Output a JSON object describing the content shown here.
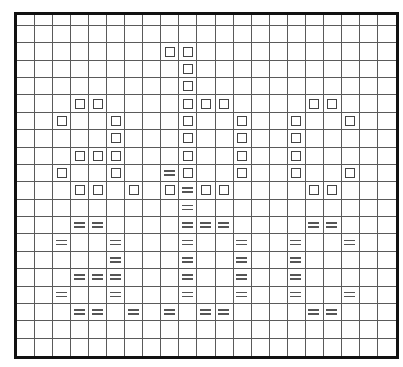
{
  "pattern": {
    "columns": 21,
    "rows": 20,
    "legend_symbols": {
      "S": "square-symbol",
      "E": "equals-symbol"
    },
    "cells": [
      {
        "row": 2,
        "col": 8,
        "symbol": "S"
      },
      {
        "row": 2,
        "col": 9,
        "symbol": "S"
      },
      {
        "row": 3,
        "col": 9,
        "symbol": "S"
      },
      {
        "row": 4,
        "col": 9,
        "symbol": "S"
      },
      {
        "row": 5,
        "col": 3,
        "symbol": "S"
      },
      {
        "row": 5,
        "col": 4,
        "symbol": "S"
      },
      {
        "row": 5,
        "col": 9,
        "symbol": "S"
      },
      {
        "row": 5,
        "col": 10,
        "symbol": "S"
      },
      {
        "row": 5,
        "col": 11,
        "symbol": "S"
      },
      {
        "row": 5,
        "col": 16,
        "symbol": "S"
      },
      {
        "row": 5,
        "col": 17,
        "symbol": "S"
      },
      {
        "row": 6,
        "col": 2,
        "symbol": "S"
      },
      {
        "row": 6,
        "col": 5,
        "symbol": "S"
      },
      {
        "row": 6,
        "col": 9,
        "symbol": "S"
      },
      {
        "row": 6,
        "col": 12,
        "symbol": "S"
      },
      {
        "row": 6,
        "col": 15,
        "symbol": "S"
      },
      {
        "row": 6,
        "col": 18,
        "symbol": "S"
      },
      {
        "row": 7,
        "col": 5,
        "symbol": "S"
      },
      {
        "row": 7,
        "col": 9,
        "symbol": "S"
      },
      {
        "row": 7,
        "col": 12,
        "symbol": "S"
      },
      {
        "row": 7,
        "col": 15,
        "symbol": "S"
      },
      {
        "row": 8,
        "col": 3,
        "symbol": "S"
      },
      {
        "row": 8,
        "col": 4,
        "symbol": "S"
      },
      {
        "row": 8,
        "col": 5,
        "symbol": "S"
      },
      {
        "row": 8,
        "col": 9,
        "symbol": "S"
      },
      {
        "row": 8,
        "col": 12,
        "symbol": "S"
      },
      {
        "row": 8,
        "col": 15,
        "symbol": "S"
      },
      {
        "row": 9,
        "col": 2,
        "symbol": "S"
      },
      {
        "row": 9,
        "col": 5,
        "symbol": "S"
      },
      {
        "row": 9,
        "col": 8,
        "symbol": "E"
      },
      {
        "row": 9,
        "col": 9,
        "symbol": "S"
      },
      {
        "row": 9,
        "col": 12,
        "symbol": "S"
      },
      {
        "row": 9,
        "col": 15,
        "symbol": "S"
      },
      {
        "row": 9,
        "col": 18,
        "symbol": "S"
      },
      {
        "row": 10,
        "col": 3,
        "symbol": "S"
      },
      {
        "row": 10,
        "col": 4,
        "symbol": "S"
      },
      {
        "row": 10,
        "col": 6,
        "symbol": "S"
      },
      {
        "row": 10,
        "col": 8,
        "symbol": "S"
      },
      {
        "row": 10,
        "col": 9,
        "symbol": "E"
      },
      {
        "row": 10,
        "col": 10,
        "symbol": "S"
      },
      {
        "row": 10,
        "col": 11,
        "symbol": "S"
      },
      {
        "row": 10,
        "col": 16,
        "symbol": "S"
      },
      {
        "row": 10,
        "col": 17,
        "symbol": "S"
      },
      {
        "row": 11,
        "col": 9,
        "symbol": "E"
      },
      {
        "row": 12,
        "col": 3,
        "symbol": "E"
      },
      {
        "row": 12,
        "col": 4,
        "symbol": "E"
      },
      {
        "row": 12,
        "col": 9,
        "symbol": "E"
      },
      {
        "row": 12,
        "col": 10,
        "symbol": "E"
      },
      {
        "row": 12,
        "col": 11,
        "symbol": "E"
      },
      {
        "row": 12,
        "col": 16,
        "symbol": "E"
      },
      {
        "row": 12,
        "col": 17,
        "symbol": "E"
      },
      {
        "row": 13,
        "col": 2,
        "symbol": "E"
      },
      {
        "row": 13,
        "col": 5,
        "symbol": "E"
      },
      {
        "row": 13,
        "col": 9,
        "symbol": "E"
      },
      {
        "row": 13,
        "col": 12,
        "symbol": "E"
      },
      {
        "row": 13,
        "col": 15,
        "symbol": "E"
      },
      {
        "row": 13,
        "col": 18,
        "symbol": "E"
      },
      {
        "row": 14,
        "col": 5,
        "symbol": "E"
      },
      {
        "row": 14,
        "col": 9,
        "symbol": "E"
      },
      {
        "row": 14,
        "col": 12,
        "symbol": "E"
      },
      {
        "row": 14,
        "col": 15,
        "symbol": "E"
      },
      {
        "row": 15,
        "col": 3,
        "symbol": "E"
      },
      {
        "row": 15,
        "col": 4,
        "symbol": "E"
      },
      {
        "row": 15,
        "col": 5,
        "symbol": "E"
      },
      {
        "row": 15,
        "col": 9,
        "symbol": "E"
      },
      {
        "row": 15,
        "col": 12,
        "symbol": "E"
      },
      {
        "row": 15,
        "col": 15,
        "symbol": "E"
      },
      {
        "row": 16,
        "col": 2,
        "symbol": "E"
      },
      {
        "row": 16,
        "col": 5,
        "symbol": "E"
      },
      {
        "row": 16,
        "col": 9,
        "symbol": "E"
      },
      {
        "row": 16,
        "col": 12,
        "symbol": "E"
      },
      {
        "row": 16,
        "col": 15,
        "symbol": "E"
      },
      {
        "row": 16,
        "col": 18,
        "symbol": "E"
      },
      {
        "row": 17,
        "col": 3,
        "symbol": "E"
      },
      {
        "row": 17,
        "col": 4,
        "symbol": "E"
      },
      {
        "row": 17,
        "col": 6,
        "symbol": "E"
      },
      {
        "row": 17,
        "col": 8,
        "symbol": "E"
      },
      {
        "row": 17,
        "col": 10,
        "symbol": "E"
      },
      {
        "row": 17,
        "col": 11,
        "symbol": "E"
      },
      {
        "row": 17,
        "col": 16,
        "symbol": "E"
      },
      {
        "row": 17,
        "col": 17,
        "symbol": "E"
      }
    ],
    "colors": {
      "border": "#111111",
      "grid_line": "#5a5a5a",
      "symbol": "#444444",
      "background": "#ffffff"
    }
  }
}
